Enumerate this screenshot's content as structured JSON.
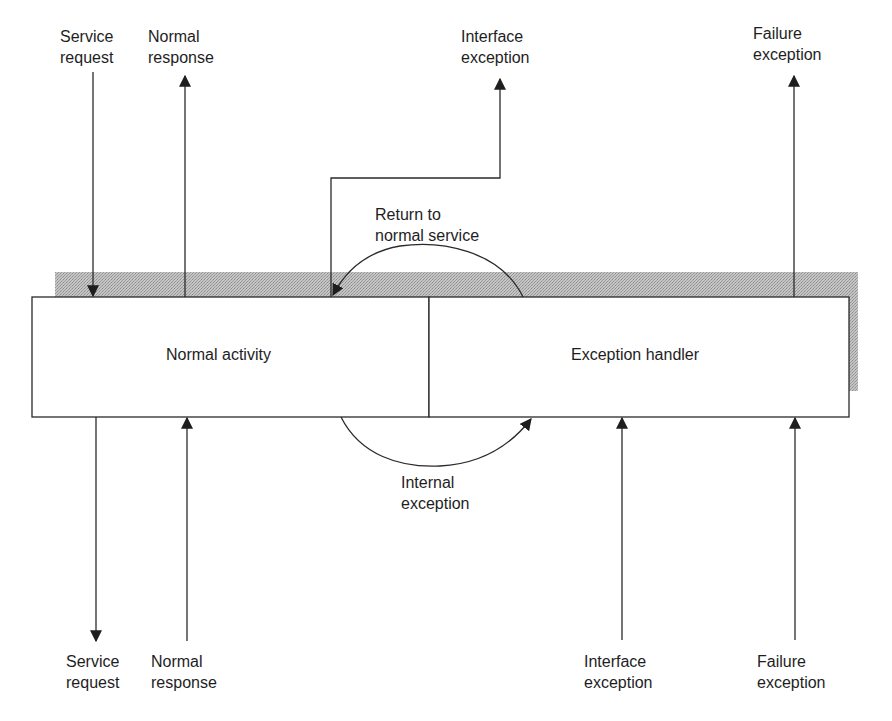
{
  "diagram": {
    "type": "exception-handling-component",
    "colors": {
      "line": "#2a2a2a",
      "shadow": "#b8b8b8",
      "background": "#ffffff"
    },
    "boxes": [
      {
        "id": "normal-activity",
        "label": "Normal activity"
      },
      {
        "id": "exception-handler",
        "label": "Exception handler"
      }
    ],
    "top_labels": {
      "service_request": {
        "line1": "Service",
        "line2": "request",
        "direction": "down"
      },
      "normal_response": {
        "line1": "Normal",
        "line2": "response",
        "direction": "up"
      },
      "interface_exception": {
        "line1": "Interface",
        "line2": "exception",
        "direction": "up"
      },
      "failure_exception": {
        "line1": "Failure",
        "line2": "exception",
        "direction": "up"
      }
    },
    "bottom_labels": {
      "service_request": {
        "line1": "Service",
        "line2": "request",
        "direction": "down"
      },
      "normal_response": {
        "line1": "Normal",
        "line2": "response",
        "direction": "up"
      },
      "interface_exception": {
        "line1": "Interface",
        "line2": "exception",
        "direction": "up"
      },
      "failure_exception": {
        "line1": "Failure",
        "line2": "exception",
        "direction": "up"
      }
    },
    "transitions": {
      "return_to_normal": {
        "line1": "Return to",
        "line2": "normal service",
        "from": "exception-handler",
        "to": "normal-activity"
      },
      "internal_exception": {
        "line1": "Internal",
        "line2": "exception",
        "from": "normal-activity",
        "to": "exception-handler"
      }
    }
  }
}
